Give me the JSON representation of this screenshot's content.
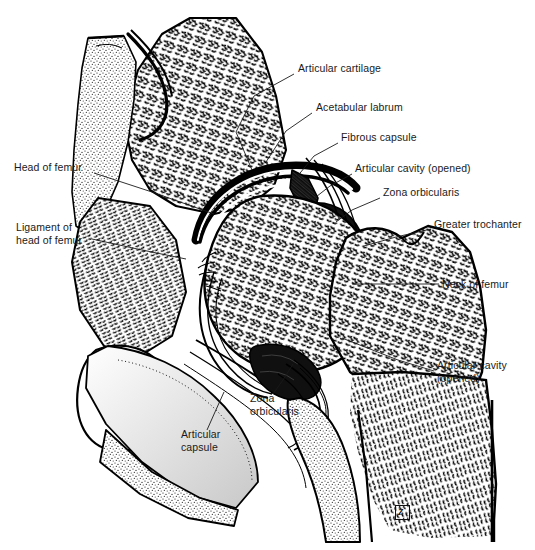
{
  "figure": {
    "kind": "anatomical-illustration",
    "style": "black-and-white stipple and line engraving",
    "width": 535,
    "height": 550,
    "background_color": "#ffffff",
    "ink_color": "#000000"
  },
  "labels": [
    {
      "id": "articular-cartilage",
      "text": "Articular cartilage",
      "x": 298,
      "y": 68,
      "align": "left",
      "leader": [
        [
          293,
          76
        ],
        [
          258,
          92
        ],
        [
          236,
          128
        ],
        [
          252,
          168
        ]
      ]
    },
    {
      "id": "acetabular-labrum",
      "text": "Acetabular labrum",
      "x": 316,
      "y": 107,
      "align": "left",
      "leader": [
        [
          311,
          114
        ],
        [
          286,
          130
        ],
        [
          262,
          160
        ]
      ]
    },
    {
      "id": "fibrous-capsule",
      "text": "Fibrous capsule",
      "x": 341,
      "y": 137,
      "align": "left",
      "leader": [
        [
          337,
          144
        ],
        [
          312,
          156
        ],
        [
          292,
          178
        ]
      ]
    },
    {
      "id": "articular-cavity-top",
      "text": "Articular cavity (opened)",
      "x": 355,
      "y": 168,
      "align": "left",
      "leader": [
        [
          351,
          175
        ],
        [
          330,
          186
        ],
        [
          309,
          199
        ]
      ]
    },
    {
      "id": "zona-orbicularis-top",
      "text": "Zona orbicularis",
      "x": 383,
      "y": 192,
      "align": "left",
      "leader": [
        [
          379,
          199
        ],
        [
          352,
          210
        ],
        [
          333,
          221
        ]
      ]
    },
    {
      "id": "greater-trochanter",
      "text": "Greater trochanter",
      "x": 434,
      "y": 224,
      "align": "left",
      "leader": [
        [
          430,
          230
        ],
        [
          396,
          238
        ],
        [
          363,
          246
        ]
      ]
    },
    {
      "id": "neck-of-femur",
      "text": "Neck of femur",
      "x": 442,
      "y": 280,
      "align": "left",
      "leader": [
        [
          438,
          285
        ],
        [
          398,
          285
        ],
        [
          350,
          285
        ]
      ]
    },
    {
      "id": "articular-cavity-low",
      "text": "Articular cavity\n(opened)",
      "x": 437,
      "y": 365,
      "align": "left",
      "leader": [
        [
          433,
          372
        ],
        [
          400,
          362
        ],
        [
          340,
          338
        ]
      ]
    },
    {
      "id": "head-of-femur",
      "text": "Head of femur",
      "x": 14,
      "y": 167,
      "align": "left",
      "leader": [
        [
          93,
          174
        ],
        [
          150,
          192
        ],
        [
          212,
          213
        ]
      ]
    },
    {
      "id": "ligament-of-head",
      "text": "Ligament of\nhead of femur",
      "x": 16,
      "y": 227,
      "align": "left",
      "leader": [
        [
          90,
          240
        ],
        [
          140,
          250
        ],
        [
          182,
          258
        ]
      ]
    },
    {
      "id": "articular-capsule",
      "text": "Articular\ncapsule",
      "x": 181,
      "y": 434,
      "align": "left",
      "leader": [
        [
          206,
          431
        ],
        [
          214,
          412
        ],
        [
          222,
          392
        ]
      ]
    },
    {
      "id": "zona-orbicularis-low",
      "text": "Zona\norbiculars",
      "x": 250,
      "y": 398,
      "align": "left",
      "leader": [
        [
          272,
          395
        ],
        [
          282,
          382
        ],
        [
          292,
          366
        ]
      ]
    }
  ],
  "label_text": {
    "articular_cartilage": "Articular cartilage",
    "acetabular_labrum": "Acetabular labrum",
    "fibrous_capsule": "Fibrous capsule",
    "articular_cavity_opened_upper": "Articular cavity (opened)",
    "zona_orbicularis_upper": "Zona orbicularis",
    "greater_trochanter": "Greater trochanter",
    "neck_of_femur": "Neck of femur",
    "articular_cavity_opened_lower_line1": "Articular cavity",
    "articular_cavity_opened_lower_line2": "(opened)",
    "head_of_femur": "Head of femur",
    "ligament_of_head_line1": "Ligament of",
    "ligament_of_head_line2": "head of femur",
    "articular_capsule_line1": "Articular",
    "articular_capsule_line2": "capsule",
    "zona_orbicularis_lower_line1": "Zona",
    "zona_orbicularis_lower_line2": "orbicularis"
  },
  "signature": {
    "type": "artist-monogram-stamp",
    "glyph": "Z",
    "x": 395,
    "y": 505
  }
}
